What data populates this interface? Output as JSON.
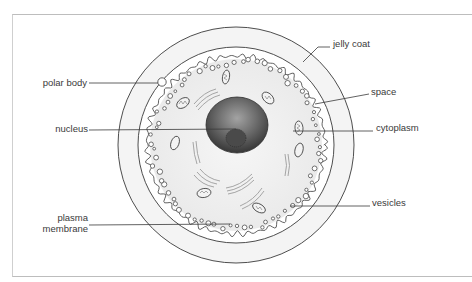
{
  "diagram": {
    "colors": {
      "line": "#3a3a3a",
      "jelly_coat_fill": "#f3f3f3",
      "space_fill": "#ffffff",
      "cytoplasm_fill": "#efefef",
      "nucleus_dark": "#3d3d3d",
      "nucleus_light": "#9a9a9a",
      "organelle": "#8a8a8a"
    },
    "labels": {
      "jelly_coat": "jelly coat",
      "polar_body": "polar body",
      "space": "space",
      "nucleus": "nucleus",
      "cytoplasm": "cytoplasm",
      "vesicles": "vesicles",
      "plasma_membrane_line1": "plasma",
      "plasma_membrane_line2": "membrane"
    }
  }
}
